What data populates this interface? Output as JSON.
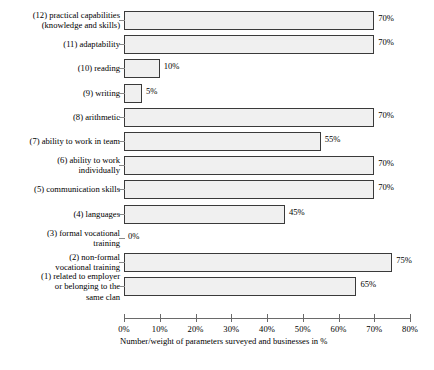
{
  "chart_data": {
    "type": "bar",
    "orientation": "horizontal",
    "title": "",
    "xlabel": "Number/weight of parameters surveyed and businesses in %",
    "ylabel": "",
    "xlim": [
      0,
      80
    ],
    "xticks": [
      "0%",
      "10%",
      "20%",
      "30%",
      "40%",
      "50%",
      "60%",
      "70%",
      "80%"
    ],
    "xtick_values": [
      0,
      10,
      20,
      30,
      40,
      50,
      60,
      70,
      80
    ],
    "grid": false,
    "legend": false,
    "categories": [
      "(12) practical capabilities\n(knowledge and skills)",
      "(11) adaptability",
      "(10) reading",
      "(9) writing",
      "(8) arithmetic",
      "(7) ability to work in team",
      "(6) ability to work\nindividually",
      "(5) communication skills",
      "(4) languages",
      "(3) formal vocational\ntraining",
      "(2) non-formal\nvocational training",
      "(1) related to employer\nor belonging to the\nsame clan"
    ],
    "values": [
      70,
      70,
      10,
      5,
      70,
      55,
      70,
      70,
      45,
      0,
      75,
      65
    ],
    "value_labels": [
      "70%",
      "70%",
      "10%",
      "5%",
      "70%",
      "55%",
      "70%",
      "70%",
      "45%",
      "0%",
      "75%",
      "65%"
    ],
    "label_lines": [
      2,
      1,
      1,
      1,
      1,
      1,
      2,
      1,
      1,
      2,
      2,
      3
    ],
    "bar_fill_color": "#f0f0f0",
    "bar_border_color": "#3a3a3a",
    "axis_color": "#6a6a6a"
  }
}
